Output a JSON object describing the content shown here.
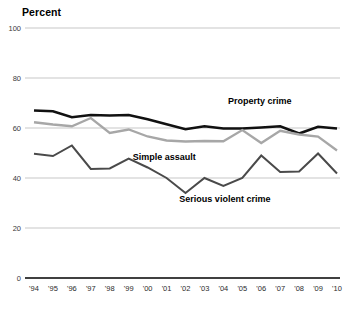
{
  "chart_data": {
    "type": "line",
    "title": "",
    "ylabel": "Percent",
    "xlabel": "",
    "ylim": [
      0,
      100
    ],
    "yticks": [
      0,
      20,
      40,
      60,
      80,
      100
    ],
    "grid": true,
    "legend_position": "inline-annotations",
    "categories": [
      "'94",
      "'95",
      "'96",
      "'97",
      "'98",
      "'99",
      "'00",
      "'01",
      "'02",
      "'03",
      "'04",
      "'05",
      "'06",
      "'07",
      "'08",
      "'09",
      "'10"
    ],
    "series": [
      {
        "name": "Property crime",
        "color": "#111111",
        "width": 2.6,
        "values": [
          67.0,
          66.7,
          64.3,
          65.2,
          65.0,
          65.2,
          63.5,
          61.5,
          59.5,
          60.7,
          59.8,
          59.8,
          60.2,
          60.7,
          57.8,
          60.5,
          59.8
        ]
      },
      {
        "name": "Simple assault",
        "color": "#a7a7a7",
        "width": 2.3,
        "values": [
          62.3,
          61.4,
          60.7,
          64.0,
          58.0,
          59.4,
          56.6,
          55.0,
          54.6,
          54.8,
          54.7,
          59.2,
          54.0,
          58.9,
          57.4,
          56.6,
          51.0
        ]
      },
      {
        "name": "Serious violent crime",
        "color": "#4a4a4a",
        "width": 2.0,
        "values": [
          49.7,
          48.8,
          53.0,
          43.6,
          43.8,
          47.8,
          44.2,
          40.0,
          34.0,
          40.0,
          36.8,
          40.0,
          49.0,
          42.4,
          42.6,
          49.8,
          41.8
        ]
      }
    ],
    "annotations": [
      {
        "text": "Property crime",
        "x_pct": 0.745,
        "y_value": 69.5
      },
      {
        "text": "Simple assault",
        "x_pct": 0.43,
        "y_value": 47.2
      },
      {
        "text": "Serious violent crime",
        "x_pct": 0.63,
        "y_value": 30.6
      }
    ]
  }
}
